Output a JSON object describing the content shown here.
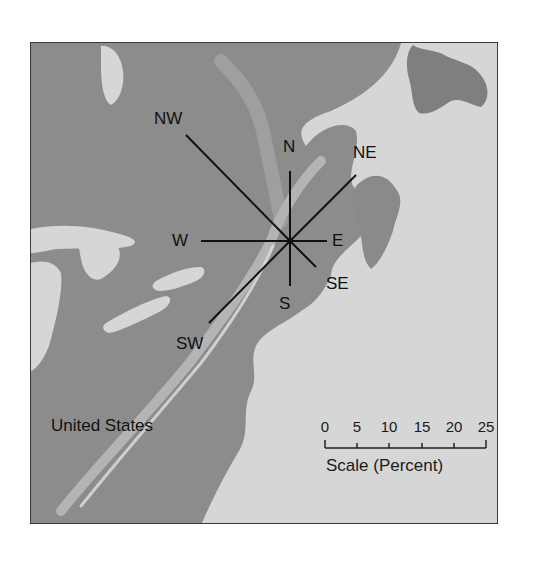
{
  "map": {
    "region_label": "United States",
    "rose": {
      "center_px": [
        289,
        240
      ],
      "px_per_percent": 6.44,
      "directions": [
        {
          "label": "N",
          "percent": 10.9
        },
        {
          "label": "NE",
          "percent": 14.5
        },
        {
          "label": "E",
          "percent": 5.7
        },
        {
          "label": "SE",
          "percent": 5.7
        },
        {
          "label": "S",
          "percent": 7.0
        },
        {
          "label": "SW",
          "percent": 17.9
        },
        {
          "label": "W",
          "percent": 13.8
        },
        {
          "label": "NW",
          "percent": 23.0
        }
      ]
    },
    "scale": {
      "title": "Scale (Percent)",
      "ticks": [
        "0",
        "5",
        "10",
        "15",
        "20",
        "25"
      ]
    },
    "colors": {
      "water": "#d6d6d6",
      "land": "#8a8a8a",
      "land_dark": "#6e6e6e",
      "ridge": "#bdbdbd",
      "rose_line": "#111111",
      "border": "#3a3a3a"
    }
  }
}
